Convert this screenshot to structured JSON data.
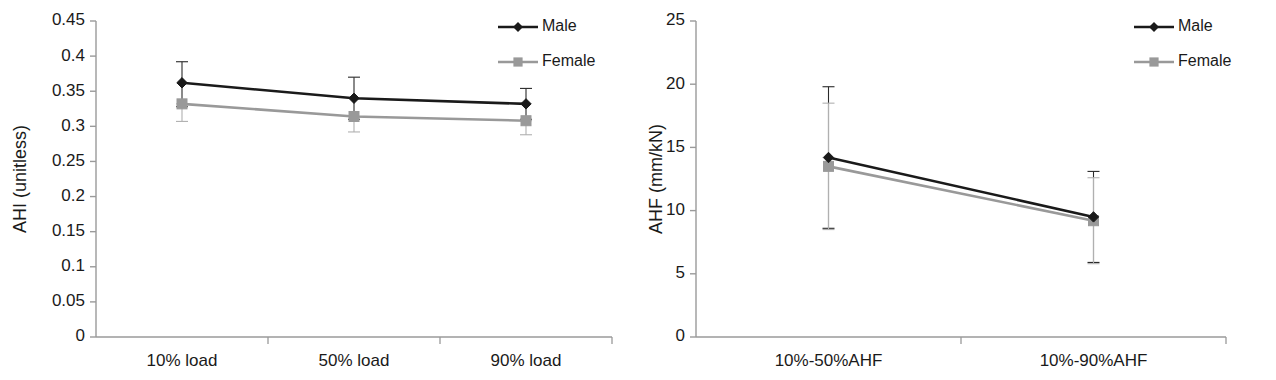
{
  "figure": {
    "background": "#ffffff",
    "panel_count": 2
  },
  "colors": {
    "male": "#1a1a1a",
    "female": "#999999",
    "axis": "#9a9a9a",
    "text": "#1a1a1a"
  },
  "legend": {
    "male_label": "Male",
    "female_label": "Female",
    "male_marker": "diamond-marker-icon",
    "female_marker": "square-marker-icon",
    "position": "top-right"
  },
  "chart_data": [
    {
      "type": "line",
      "panel": "left",
      "title": "",
      "xlabel": "",
      "ylabel": "AHI (unitless)",
      "categories": [
        "10% load",
        "50% load",
        "90% load"
      ],
      "ylim": [
        0,
        0.45
      ],
      "yticks": [
        0,
        0.05,
        0.1,
        0.15,
        0.2,
        0.25,
        0.3,
        0.35,
        0.4,
        0.45
      ],
      "ytick_labels": [
        "0",
        "0.05",
        "0.1",
        "0.15",
        "0.2",
        "0.25",
        "0.3",
        "0.35",
        "0.4",
        "0.45"
      ],
      "grid": false,
      "errorbars": true,
      "series": [
        {
          "name": "Male",
          "color": "#1a1a1a",
          "marker": "diamond",
          "values": [
            0.362,
            0.34,
            0.332
          ],
          "err_low": [
            0.034,
            0.03,
            0.022
          ],
          "err_high": [
            0.03,
            0.03,
            0.022
          ]
        },
        {
          "name": "Female",
          "color": "#999999",
          "marker": "square",
          "values": [
            0.332,
            0.314,
            0.308
          ],
          "err_low": [
            0.025,
            0.022,
            0.02
          ],
          "err_high": [
            0.0,
            0.0,
            0.0
          ]
        }
      ]
    },
    {
      "type": "line",
      "panel": "right",
      "title": "",
      "xlabel": "",
      "ylabel": "AHF (mm/kN)",
      "categories": [
        "10%-50%AHF",
        "10%-90%AHF"
      ],
      "ylim": [
        0,
        25
      ],
      "yticks": [
        0,
        5,
        10,
        15,
        20,
        25
      ],
      "ytick_labels": [
        "0",
        "5",
        "10",
        "15",
        "20",
        "25"
      ],
      "grid": false,
      "errorbars": true,
      "series": [
        {
          "name": "Male",
          "color": "#1a1a1a",
          "marker": "diamond",
          "values": [
            14.2,
            9.5
          ],
          "err_low": [
            5.6,
            3.6
          ],
          "err_high": [
            5.6,
            3.6
          ]
        },
        {
          "name": "Female",
          "color": "#999999",
          "marker": "square",
          "values": [
            13.5,
            9.2
          ],
          "err_low": [
            5.0,
            3.4
          ],
          "err_high": [
            5.0,
            3.4
          ]
        }
      ]
    }
  ]
}
